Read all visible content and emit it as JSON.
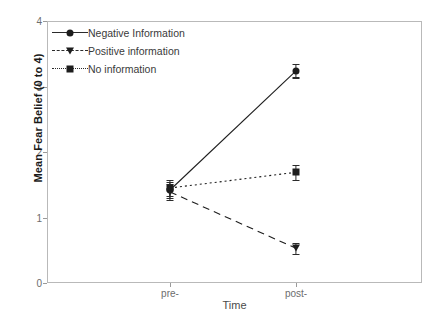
{
  "chart_data": {
    "type": "line",
    "title": "",
    "xlabel": "Time",
    "ylabel": "Mean Fear Belief (0 to 4)",
    "categories": [
      "pre-",
      "post-"
    ],
    "x_positions": [
      170,
      296
    ],
    "ylim": [
      0,
      4
    ],
    "yticks": [
      0,
      1,
      2,
      3,
      4
    ],
    "ytick_labels": [
      "0",
      "1",
      "2",
      "3",
      "4"
    ],
    "grid": false,
    "legend_position": "top-left",
    "error_bars": true,
    "series": [
      {
        "name": "Negative Information",
        "marker": "circle",
        "linestyle": "solid",
        "color": "#1d1d1d",
        "values": [
          1.42,
          3.24
        ],
        "errors": [
          0.12,
          0.1
        ]
      },
      {
        "name": "Positive information",
        "marker": "triangle-down",
        "linestyle": "dashed",
        "color": "#1d1d1d",
        "values": [
          1.39,
          0.53
        ],
        "errors": [
          0.12,
          0.08
        ]
      },
      {
        "name": "No information",
        "marker": "square",
        "linestyle": "dotted",
        "color": "#1d1d1d",
        "values": [
          1.45,
          1.69
        ],
        "errors": [
          0.12,
          0.11
        ]
      }
    ]
  },
  "axes": {
    "ylabel": "Mean Fear Belief (0 to 4)",
    "xlabel": "Time",
    "ytick_labels": [
      "4",
      "3",
      "2",
      "1",
      "0"
    ],
    "xtick_labels": [
      "pre-",
      "post-"
    ]
  },
  "legend": {
    "items": [
      {
        "label": "Negative Information",
        "marker": "circle-icon",
        "linestyle": "solid"
      },
      {
        "label": "Positive information",
        "marker": "triangle-icon",
        "linestyle": "dashed"
      },
      {
        "label": "No information",
        "marker": "square-icon",
        "linestyle": "dotted"
      }
    ]
  }
}
